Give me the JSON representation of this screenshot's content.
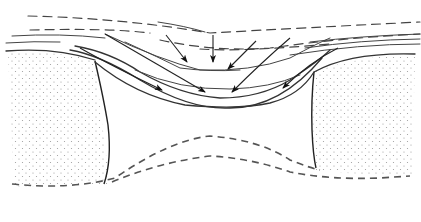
{
  "diagram": {
    "title": "",
    "colors": {
      "background": "#ffffff",
      "line": "#333333",
      "stipple": "#9a9a9a"
    },
    "elements": {
      "left_pillar": "dotted-rock-mass-left",
      "right_pillar": "dotted-rock-mass-right",
      "cavity": "void-between-pillars",
      "upper_strata": "dashed-and-solid-bedding-lines",
      "lower_boundary": "dashed-lower-boundary-lines",
      "arrows": 7
    }
  }
}
